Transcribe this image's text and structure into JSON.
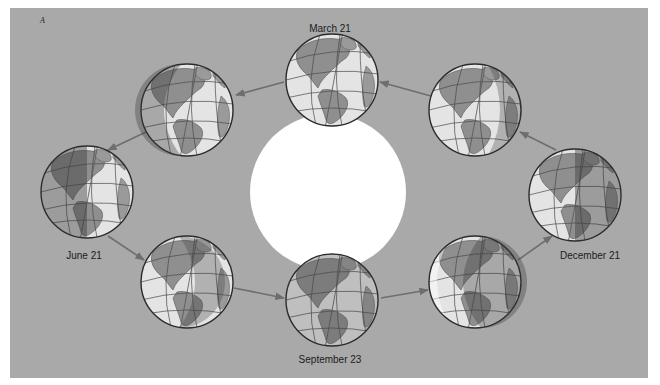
{
  "figure": {
    "panel_letter": "A",
    "background_color": "#a9a9a9",
    "sun_color": "#ffffff",
    "labels": {
      "march": "March 21",
      "june": "June 21",
      "september": "September 23",
      "december": "December 21"
    },
    "globes": [
      {
        "id": "march-21",
        "cx": 332,
        "cy": 80,
        "shade": "none"
      },
      {
        "id": "between-march-june",
        "cx": 187,
        "cy": 110,
        "shade": "left-thin"
      },
      {
        "id": "june-21",
        "cx": 87,
        "cy": 192,
        "shade": "left-half"
      },
      {
        "id": "between-june-september",
        "cx": 187,
        "cy": 282,
        "shade": "left-thin"
      },
      {
        "id": "september-23",
        "cx": 332,
        "cy": 300,
        "shade": "none"
      },
      {
        "id": "between-september-december",
        "cx": 475,
        "cy": 282,
        "shade": "right-thin"
      },
      {
        "id": "december-21",
        "cx": 575,
        "cy": 195,
        "shade": "right-half"
      },
      {
        "id": "between-december-march",
        "cx": 475,
        "cy": 110,
        "shade": "right-thin"
      }
    ],
    "orbit_direction": "counterclockwise"
  }
}
